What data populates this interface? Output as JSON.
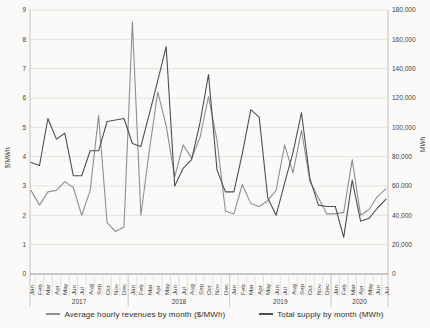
{
  "chart_data": {
    "type": "line",
    "title": "",
    "x": {
      "months": [
        "Jan",
        "Feb",
        "Mar",
        "Apr",
        "May",
        "Jun",
        "Jul",
        "Aug",
        "Sep",
        "Oct",
        "Nov",
        "Dec",
        "Jan",
        "Feb",
        "Mar",
        "Apr",
        "May",
        "Jun",
        "Jul",
        "Aug",
        "Sep",
        "Oct",
        "Nov",
        "Dec",
        "Jan",
        "Feb",
        "Mar",
        "Apr",
        "May",
        "Jun",
        "Jul",
        "Aug",
        "Sep",
        "Oct",
        "Nov",
        "Dec",
        "Jan",
        "Feb",
        "Mar",
        "Apr",
        "May",
        "Jun",
        "Jul"
      ],
      "years": [
        {
          "label": "2017",
          "months": 12
        },
        {
          "label": "2018",
          "months": 12
        },
        {
          "label": "2019",
          "months": 12
        },
        {
          "label": "2020",
          "months": 7
        }
      ]
    },
    "left_axis": {
      "label": "$/MWh",
      "min": 0,
      "max": 9,
      "ticks": [
        "0",
        "1",
        "2",
        "3",
        "4",
        "5",
        "6",
        "7",
        "8",
        "9"
      ]
    },
    "right_axis": {
      "label": "MWh",
      "min": 0,
      "max": 180000,
      "ticks": [
        "0",
        "20,000",
        "40,000",
        "60,000",
        "80,000",
        "100,000",
        "120,000",
        "140,000",
        "160,000",
        "180,000"
      ]
    },
    "grid": "horizontal",
    "legend_position": "bottom",
    "series": [
      {
        "name": "Average hourly revenues by month ($/MWh)",
        "axis": "left",
        "color": "#8f8f8f",
        "values": [
          2.85,
          2.35,
          2.8,
          2.85,
          3.15,
          2.95,
          2.0,
          2.85,
          5.4,
          1.75,
          1.45,
          1.6,
          8.6,
          2.0,
          4.2,
          6.2,
          5.05,
          3.3,
          4.4,
          3.95,
          4.65,
          6.05,
          4.55,
          2.15,
          2.05,
          3.05,
          2.4,
          2.3,
          2.5,
          2.85,
          4.4,
          3.45,
          4.9,
          3.15,
          2.6,
          2.05,
          2.05,
          2.1,
          3.9,
          2.0,
          2.2,
          2.65,
          2.9
        ]
      },
      {
        "name": "Total supply by month (MWh)",
        "axis": "right",
        "color": "#4f4f4f",
        "values": [
          76000,
          74000,
          106000,
          92000,
          96000,
          67000,
          67000,
          84000,
          84000,
          104000,
          105000,
          106000,
          89000,
          87000,
          109000,
          132000,
          155000,
          60000,
          72000,
          78000,
          103000,
          136000,
          71000,
          56000,
          56000,
          82000,
          112000,
          107000,
          52000,
          40000,
          62000,
          83000,
          110000,
          65000,
          47000,
          46000,
          46000,
          25000,
          64000,
          36000,
          38000,
          45000,
          51000
        ]
      }
    ]
  }
}
